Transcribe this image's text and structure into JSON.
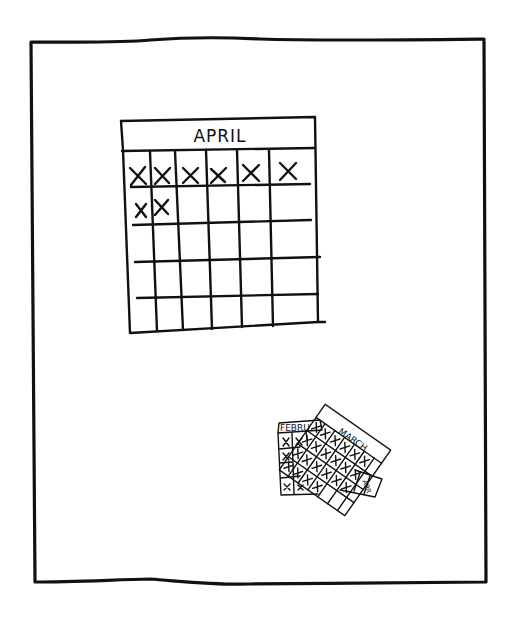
{
  "panel": {
    "style": "hand-drawn comic panel",
    "ink_color": "#111111",
    "background": "#ffffff"
  },
  "main_calendar": {
    "month_label": "APRIL",
    "columns": 6,
    "rows": 5,
    "crossed_days_row1": 6,
    "crossed_days_row2": 2,
    "mark": "X"
  },
  "discarded_calendars": {
    "pages": [
      {
        "month_label": "FEBRU",
        "all_crossed": true
      },
      {
        "month_label": "MARCH",
        "all_crossed": true
      },
      {
        "month_label": "APR",
        "all_crossed": true
      }
    ]
  }
}
